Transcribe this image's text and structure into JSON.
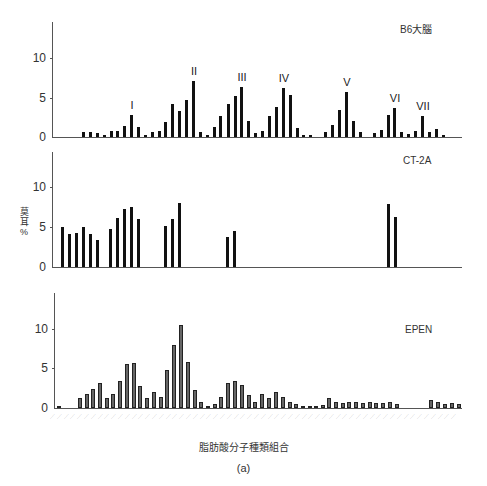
{
  "chart_data": [
    {
      "type": "bar",
      "title": "B6大腦",
      "ylabel": "莫耳%",
      "xlabel": "脂肪酸分子種類組合",
      "ylim": [
        0,
        14
      ],
      "yticks": [
        0,
        5,
        10
      ],
      "peak_labels": [
        {
          "label": "I",
          "x": 131
        },
        {
          "label": "II",
          "x": 193
        },
        {
          "label": "III",
          "x": 241
        },
        {
          "label": "IV",
          "x": 283
        },
        {
          "label": "V",
          "x": 346
        },
        {
          "label": "VI",
          "x": 394
        },
        {
          "label": "VII",
          "x": 422
        }
      ],
      "bars": [
        [
          83,
          0.6
        ],
        [
          90,
          0.6
        ],
        [
          97,
          0.5
        ],
        [
          104,
          0.2
        ],
        [
          111,
          0.8
        ],
        [
          117,
          0.8
        ],
        [
          124,
          1.4
        ],
        [
          131,
          2.8
        ],
        [
          138,
          1.3
        ],
        [
          145,
          0.2
        ],
        [
          152,
          0.6
        ],
        [
          159,
          0.7
        ],
        [
          165,
          1.9
        ],
        [
          172,
          4.2
        ],
        [
          179,
          3.3
        ],
        [
          186,
          4.7
        ],
        [
          193,
          7.1
        ],
        [
          200,
          0.6
        ],
        [
          207,
          0.3
        ],
        [
          214,
          1.2
        ],
        [
          220,
          2.7
        ],
        [
          228,
          4.1
        ],
        [
          235,
          5.1
        ],
        [
          241,
          6.3
        ],
        [
          248,
          2.0
        ],
        [
          255,
          0.5
        ],
        [
          262,
          0.7
        ],
        [
          269,
          2.7
        ],
        [
          276,
          3.8
        ],
        [
          283,
          6.2
        ],
        [
          290,
          5.3
        ],
        [
          297,
          1.1
        ],
        [
          303,
          0.3
        ],
        [
          310,
          0.2
        ],
        [
          325,
          0.6
        ],
        [
          332,
          1.5
        ],
        [
          339,
          3.4
        ],
        [
          346,
          5.7
        ],
        [
          353,
          2.0
        ],
        [
          360,
          0.6
        ],
        [
          374,
          0.5
        ],
        [
          381,
          0.9
        ],
        [
          388,
          2.8
        ],
        [
          394,
          3.6
        ],
        [
          401,
          0.6
        ],
        [
          408,
          0.4
        ],
        [
          415,
          0.7
        ],
        [
          422,
          2.6
        ],
        [
          429,
          0.6
        ],
        [
          436,
          1.0
        ],
        [
          443,
          0.2
        ]
      ]
    },
    {
      "type": "bar",
      "title": "CT-2A",
      "ylabel": "莫耳%",
      "ylim": [
        0,
        14
      ],
      "yticks": [
        0,
        5,
        10
      ],
      "bars": [
        [
          62,
          5.0
        ],
        [
          69,
          4.1
        ],
        [
          76,
          4.3
        ],
        [
          83,
          5.0
        ],
        [
          90,
          4.2
        ],
        [
          97,
          3.4
        ],
        [
          110,
          4.8
        ],
        [
          117,
          6.2
        ],
        [
          124,
          7.3
        ],
        [
          131,
          7.6
        ],
        [
          138,
          6.0
        ],
        [
          165,
          5.2
        ],
        [
          172,
          6.1
        ],
        [
          179,
          8.0
        ],
        [
          227,
          3.8
        ],
        [
          234,
          4.5
        ],
        [
          388,
          7.9
        ],
        [
          395,
          6.3
        ]
      ]
    },
    {
      "type": "bar",
      "title": "EPEN",
      "ylabel": "莫耳%",
      "ylim": [
        0,
        14
      ],
      "yticks": [
        0,
        5,
        10
      ],
      "bars": [
        [
          58,
          0.3
        ],
        [
          79,
          1.2
        ],
        [
          86,
          1.8
        ],
        [
          92,
          2.4
        ],
        [
          99,
          3.2
        ],
        [
          106,
          1.3
        ],
        [
          112,
          1.7
        ],
        [
          119,
          3.4
        ],
        [
          126,
          5.5
        ],
        [
          133,
          5.6
        ],
        [
          139,
          2.8
        ],
        [
          146,
          1.2
        ],
        [
          153,
          2.0
        ],
        [
          160,
          1.4
        ],
        [
          166,
          4.8
        ],
        [
          173,
          7.9
        ],
        [
          180,
          10.5
        ],
        [
          187,
          5.8
        ],
        [
          194,
          2.3
        ],
        [
          200,
          0.8
        ],
        [
          207,
          0.2
        ],
        [
          214,
          0.5
        ],
        [
          220,
          1.4
        ],
        [
          227,
          3.1
        ],
        [
          234,
          3.4
        ],
        [
          241,
          2.9
        ],
        [
          248,
          1.6
        ],
        [
          254,
          0.8
        ],
        [
          261,
          1.8
        ],
        [
          268,
          1.3
        ],
        [
          275,
          2.0
        ],
        [
          282,
          1.4
        ],
        [
          289,
          0.8
        ],
        [
          295,
          0.5
        ],
        [
          302,
          0.3
        ],
        [
          309,
          0.2
        ],
        [
          315,
          0.3
        ],
        [
          322,
          0.4
        ],
        [
          328,
          1.3
        ],
        [
          335,
          0.7
        ],
        [
          342,
          0.6
        ],
        [
          348,
          0.7
        ],
        [
          355,
          0.7
        ],
        [
          362,
          0.6
        ],
        [
          369,
          0.8
        ],
        [
          375,
          0.6
        ],
        [
          382,
          0.6
        ],
        [
          389,
          0.7
        ],
        [
          396,
          0.5
        ],
        [
          430,
          1.0
        ],
        [
          437,
          0.8
        ],
        [
          444,
          0.5
        ],
        [
          451,
          0.6
        ],
        [
          458,
          0.5
        ]
      ]
    }
  ],
  "figure": {
    "xlabel": "脂肪酸分子種類組合",
    "caption": "(a)",
    "ylabel_line1": "莫",
    "ylabel_line2": "耳",
    "ylabel_line3": "%"
  },
  "panels": {
    "top": {
      "title": "B6大腦",
      "t0": "0",
      "t5": "5",
      "t10": "10"
    },
    "mid": {
      "title": "CT-2A",
      "t0": "0",
      "t5": "5",
      "t10": "10"
    },
    "bot": {
      "title": "EPEN",
      "t0": "0",
      "t5": "5",
      "t10": "10"
    }
  }
}
